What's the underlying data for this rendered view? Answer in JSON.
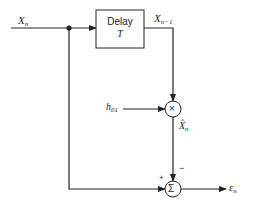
{
  "diagram": {
    "input": {
      "var": "X",
      "sub": "n"
    },
    "delay_block": {
      "line1": "Delay",
      "line2": "T"
    },
    "delayed_output": {
      "var": "X",
      "sub": "n−1"
    },
    "coefficient": {
      "var": "h",
      "sub": "01"
    },
    "multiplier_symbol": "×",
    "prediction": {
      "var": "X̂",
      "sub": "n"
    },
    "summer_symbol": "Σ",
    "plus_sign": "+",
    "minus_sign": "−",
    "output": {
      "var": "ε",
      "sub": "n"
    },
    "colors": {
      "line": "#222222",
      "background": "#ffffff"
    }
  }
}
